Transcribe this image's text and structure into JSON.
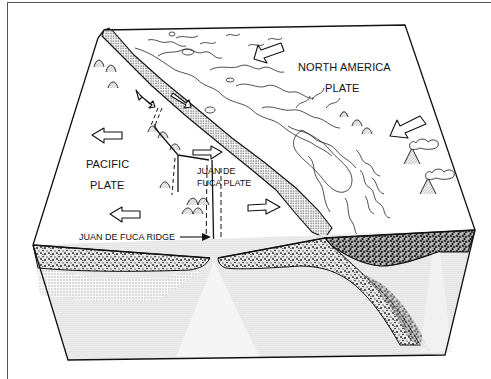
{
  "diagram": {
    "type": "block-diagram",
    "labels": {
      "north_america_line1": "NORTH AMERICA",
      "north_america_line2": "PLATE",
      "pacific_line1": "PACIFIC",
      "pacific_line2": "PLATE",
      "juan_de_fuca_line1": "JUAN DE",
      "juan_de_fuca_line2": "FUCA PLATE",
      "ridge": "JUAN DE FUCA RIDGE"
    },
    "arrows": [
      {
        "name": "north-america-motion-top",
        "direction": "southwest"
      },
      {
        "name": "north-america-motion-right",
        "direction": "southwest"
      },
      {
        "name": "pacific-motion-upper",
        "direction": "west"
      },
      {
        "name": "pacific-motion-lower",
        "direction": "west"
      },
      {
        "name": "juan-de-fuca-motion-upper",
        "direction": "east"
      },
      {
        "name": "juan-de-fuca-motion-lower",
        "direction": "east"
      },
      {
        "name": "transform-motion-northwest",
        "direction": "northwest"
      },
      {
        "name": "transform-motion-southeast",
        "direction": "southeast"
      }
    ],
    "features": [
      "subduction trench",
      "spreading ridge",
      "transform faults",
      "volcanoes",
      "seamounts",
      "coastline",
      "oceanic crust",
      "continental crust",
      "mantle"
    ],
    "colors": {
      "line": "#111111",
      "background": "#ffffff",
      "stipple_light": "#cfcfcf",
      "stipple_dark": "#555555"
    }
  }
}
